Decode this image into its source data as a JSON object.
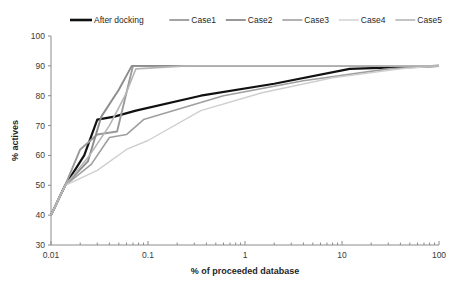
{
  "chart_data": {
    "type": "line",
    "title": "",
    "xlabel": "% of proceeded database",
    "ylabel": "% actives",
    "xscale": "log",
    "xlim": [
      0.01,
      100
    ],
    "ylim": [
      30,
      100
    ],
    "xticks": [
      0.01,
      0.1,
      1,
      10,
      100
    ],
    "xtick_labels": [
      "0.01",
      "0.1",
      "1",
      "10",
      "100"
    ],
    "yticks": [
      30,
      40,
      50,
      60,
      70,
      80,
      90,
      100
    ],
    "ytick_labels": [
      "30",
      "40",
      "50",
      "60",
      "70",
      "80",
      "90",
      "100"
    ],
    "grid": false,
    "legend_position": "top",
    "series": [
      {
        "name": "After docking",
        "color": "#111111",
        "width": 2.2,
        "x": [
          0.01,
          0.014,
          0.022,
          0.03,
          0.045,
          0.075,
          0.35,
          2.0,
          12,
          100
        ],
        "y": [
          40,
          50,
          60,
          72,
          73,
          75,
          80,
          84,
          89,
          90
        ]
      },
      {
        "name": "Case1",
        "color": "#9a9a9a",
        "width": 1.9,
        "x": [
          0.01,
          0.014,
          0.02,
          0.03,
          0.048,
          0.07,
          0.3,
          100
        ],
        "y": [
          40,
          50,
          62,
          67,
          68,
          90,
          90,
          90
        ]
      },
      {
        "name": "Case2",
        "color": "#8d8d8d",
        "width": 1.9,
        "x": [
          0.01,
          0.014,
          0.024,
          0.033,
          0.05,
          0.068,
          0.3,
          100
        ],
        "y": [
          40,
          50,
          58,
          73,
          82,
          90,
          90,
          90
        ]
      },
      {
        "name": "Case3",
        "color": "#9f9f9f",
        "width": 1.6,
        "x": [
          0.01,
          0.014,
          0.026,
          0.04,
          0.06,
          0.09,
          0.6,
          4,
          30,
          100
        ],
        "y": [
          40,
          50,
          57,
          66,
          67,
          72,
          80,
          85,
          89,
          90
        ]
      },
      {
        "name": "Case4",
        "color": "#cfcfcf",
        "width": 1.4,
        "x": [
          0.01,
          0.014,
          0.03,
          0.06,
          0.1,
          0.35,
          1.5,
          8,
          40,
          100
        ],
        "y": [
          40,
          50,
          55,
          62,
          65,
          75,
          81,
          86,
          89,
          90
        ]
      },
      {
        "name": "Case5",
        "color": "#b5b5b5",
        "width": 1.6,
        "x": [
          0.01,
          0.014,
          0.025,
          0.04,
          0.058,
          0.075,
          0.25,
          100
        ],
        "y": [
          40,
          50,
          60,
          70,
          80,
          89,
          90,
          90
        ]
      }
    ]
  },
  "legend": {
    "items": [
      {
        "label": "After docking",
        "color": "#111111",
        "width": 2.6
      },
      {
        "label": "Case1",
        "color": "#9a9a9a",
        "width": 1.8
      },
      {
        "label": "Case2",
        "color": "#8d8d8d",
        "width": 1.8
      },
      {
        "label": "Case3",
        "color": "#9f9f9f",
        "width": 1.6
      },
      {
        "label": "Case4",
        "color": "#cfcfcf",
        "width": 1.4
      },
      {
        "label": "Case5",
        "color": "#b5b5b5",
        "width": 1.6
      }
    ]
  }
}
